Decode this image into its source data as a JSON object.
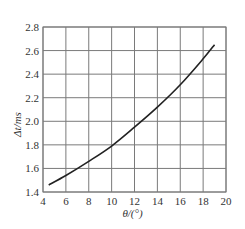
{
  "chart_data": {
    "type": "line",
    "title": "",
    "xlabel": "θ/(°)",
    "ylabel": "Δt/ms",
    "xlim": [
      4,
      20
    ],
    "ylim": [
      1.4,
      2.8
    ],
    "grid": true,
    "legend": null,
    "x_ticks": [
      "4",
      "6",
      "8",
      "10",
      "12",
      "14",
      "16",
      "18",
      "20"
    ],
    "y_ticks": [
      "1.4",
      "1.6",
      "1.8",
      "2.0",
      "2.2",
      "2.4",
      "2.6",
      "2.8"
    ],
    "series": [
      {
        "name": "Δt vs θ",
        "x": [
          4.5,
          6,
          8,
          10,
          12,
          14,
          16,
          18,
          19
        ],
        "values": [
          1.46,
          1.54,
          1.66,
          1.79,
          1.95,
          2.12,
          2.31,
          2.53,
          2.65
        ]
      }
    ]
  },
  "colors": {
    "grid": "#7a7a7a",
    "curve": "#222222",
    "text": "#333333"
  }
}
